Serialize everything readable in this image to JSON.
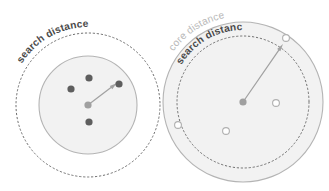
{
  "figure": {
    "background_color": "#ffffff",
    "colors": {
      "dashed_stroke": "#6f6f6f",
      "solid_stroke": "#b4b4b4",
      "disc_fill": "#f2f2f2",
      "point_dark": "#5e5e5e",
      "point_center": "#a0a0a0",
      "point_hollow_stroke": "#b0b0b0",
      "radius_arrow": "#a2a2a2",
      "label_dark": "#4a4a4a",
      "label_light": "#b9b9b9"
    },
    "panels": [
      {
        "id": "left-panel",
        "name": "search-distance-only-diagram",
        "center": {
          "x": 88,
          "y": 105
        },
        "circles": [
          {
            "name": "search-distance-dashed-circle",
            "style": "dashed",
            "radius": 72,
            "filled": false,
            "label": "search distance"
          },
          {
            "name": "inner-solid-disc",
            "style": "solid",
            "radius": 49,
            "filled": true,
            "label": ""
          }
        ],
        "labels": [
          {
            "name": "search-distance-label",
            "text": "search distance",
            "weight": "bold",
            "tone": "dark",
            "arc_radius": 78,
            "start_angle_deg": 212,
            "sweep_deg": 58
          }
        ],
        "center_point": {
          "name": "center-point",
          "x": 88,
          "y": 105,
          "radius": 3.6,
          "fill": "center"
        },
        "points": [
          {
            "name": "neighbour-point",
            "x": 71,
            "y": 89,
            "radius": 3.6,
            "fill": "dark"
          },
          {
            "name": "neighbour-point",
            "x": 89,
            "y": 78,
            "radius": 3.6,
            "fill": "dark"
          },
          {
            "name": "neighbour-point",
            "x": 119,
            "y": 84,
            "radius": 3.6,
            "fill": "dark"
          },
          {
            "name": "neighbour-point",
            "x": 89,
            "y": 122,
            "radius": 3.6,
            "fill": "dark"
          }
        ],
        "radius_arrow": {
          "name": "search-radius-arrow",
          "from": {
            "x": 88,
            "y": 105
          },
          "to": {
            "x": 117,
            "y": 83
          },
          "arrowhead": true
        }
      },
      {
        "id": "right-panel",
        "name": "core-and-search-distance-diagram",
        "center": {
          "x": 243,
          "y": 102
        },
        "circles": [
          {
            "name": "core-distance-solid-circle",
            "style": "solid",
            "radius": 80,
            "filled": true,
            "label": "core distance"
          },
          {
            "name": "search-distance-dashed-circle",
            "style": "dashed",
            "radius": 66,
            "filled": false,
            "label": "search distance"
          }
        ],
        "labels": [
          {
            "name": "core-distance-label",
            "text": "core distance",
            "weight": "normal",
            "tone": "light",
            "arc_radius": 86,
            "start_angle_deg": 216,
            "sweep_deg": 54
          },
          {
            "name": "search-distance-label",
            "text": "search distance",
            "weight": "bold",
            "tone": "dark",
            "arc_radius": 72,
            "start_angle_deg": 211,
            "sweep_deg": 58
          }
        ],
        "center_point": {
          "name": "center-point",
          "x": 243,
          "y": 102,
          "radius": 3.6,
          "fill": "center"
        },
        "points": [
          {
            "name": "neighbour-point-hollow",
            "x": 276,
            "y": 103,
            "radius": 3.4,
            "fill": "hollow"
          },
          {
            "name": "neighbour-point-hollow",
            "x": 226,
            "y": 131,
            "radius": 3.4,
            "fill": "hollow"
          },
          {
            "name": "neighbour-point-hollow",
            "x": 178,
            "y": 125,
            "radius": 3.4,
            "fill": "hollow"
          },
          {
            "name": "core-point-hollow",
            "x": 286,
            "y": 38,
            "radius": 3.4,
            "fill": "hollow"
          }
        ],
        "radius_arrow": {
          "name": "core-radius-arrow",
          "from": {
            "x": 243,
            "y": 102
          },
          "to": {
            "x": 283,
            "y": 44
          },
          "arrowhead": true
        }
      }
    ]
  }
}
